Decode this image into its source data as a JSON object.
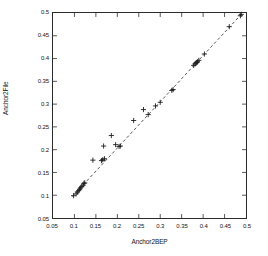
{
  "chart_data": {
    "type": "scatter",
    "title": "",
    "xlabel": "Anchor2BEP",
    "ylabel": "Anchor2File",
    "xlim": [
      0.05,
      0.5
    ],
    "ylim": [
      0.05,
      0.5
    ],
    "xticks": [
      0.05,
      0.1,
      0.15,
      0.2,
      0.25,
      0.3,
      0.35,
      0.4,
      0.45,
      0.5
    ],
    "yticks": [
      0.05,
      0.1,
      0.15,
      0.2,
      0.25,
      0.3,
      0.35,
      0.4,
      0.45,
      0.5
    ],
    "xtick_labels": [
      "0.05",
      "0.1",
      "0.15",
      "0.2",
      "0.25",
      "0.3",
      "0.35",
      "0.4",
      "0.45",
      "0.5"
    ],
    "ytick_labels": [
      "0.05",
      "0.1",
      "0.15",
      "0.2",
      "0.25",
      "0.3",
      "0.35",
      "0.4",
      "0.45",
      "0.5"
    ],
    "grid": false,
    "legend": false,
    "marker": "plus",
    "marker_color": "#1c1c1c",
    "tick_direction": "in",
    "frame": "box",
    "series": [
      {
        "name": "Anchor2File vs Anchor2BEP",
        "marker": "plus",
        "points": [
          [
            0.098,
            0.099
          ],
          [
            0.104,
            0.103
          ],
          [
            0.107,
            0.107
          ],
          [
            0.11,
            0.11
          ],
          [
            0.112,
            0.113
          ],
          [
            0.114,
            0.116
          ],
          [
            0.117,
            0.119
          ],
          [
            0.12,
            0.122
          ],
          [
            0.122,
            0.126
          ],
          [
            0.124,
            0.127
          ],
          [
            0.143,
            0.177
          ],
          [
            0.163,
            0.176
          ],
          [
            0.166,
            0.178
          ],
          [
            0.168,
            0.208
          ],
          [
            0.17,
            0.18
          ],
          [
            0.186,
            0.231
          ],
          [
            0.196,
            0.211
          ],
          [
            0.204,
            0.207
          ],
          [
            0.207,
            0.208
          ],
          [
            0.238,
            0.264
          ],
          [
            0.261,
            0.288
          ],
          [
            0.272,
            0.277
          ],
          [
            0.289,
            0.296
          ],
          [
            0.3,
            0.304
          ],
          [
            0.327,
            0.33
          ],
          [
            0.33,
            0.332
          ],
          [
            0.378,
            0.385
          ],
          [
            0.381,
            0.388
          ],
          [
            0.383,
            0.39
          ],
          [
            0.385,
            0.391
          ],
          [
            0.387,
            0.393
          ],
          [
            0.39,
            0.396
          ],
          [
            0.403,
            0.41
          ],
          [
            0.461,
            0.47
          ],
          [
            0.487,
            0.494
          ],
          [
            0.489,
            0.497
          ]
        ]
      }
    ],
    "reference_line": {
      "name": "y = x",
      "style": "dashed",
      "color": "#2b2b2b",
      "from": [
        0.095,
        0.097
      ],
      "to": [
        0.492,
        0.5
      ]
    }
  }
}
